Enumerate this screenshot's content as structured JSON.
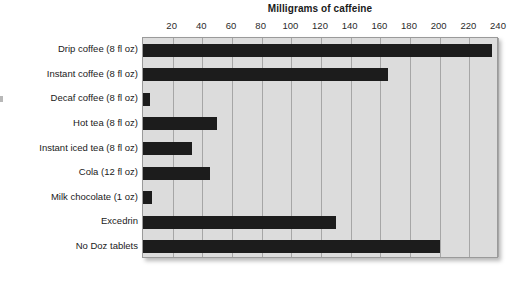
{
  "chart_data": {
    "type": "bar",
    "orientation": "horizontal",
    "title": "Milligrams of caffeine",
    "xlabel": "",
    "ylabel": "",
    "xlim": [
      0,
      240
    ],
    "xticks": [
      20,
      40,
      60,
      80,
      100,
      120,
      140,
      160,
      180,
      200,
      220,
      240
    ],
    "grid": true,
    "legend": false,
    "categories": [
      "Drip coffee (8 fl oz)",
      "Instant coffee (8 fl oz)",
      "Decaf coffee (8 fl oz)",
      "Hot tea (8 fl oz)",
      "Instant iced tea (8 fl oz)",
      "Cola (12 fl oz)",
      "Milk chocolate (1 oz)",
      "Excedrin",
      "No Doz tablets"
    ],
    "values": [
      235,
      165,
      5,
      50,
      33,
      45,
      6,
      130,
      200
    ],
    "bar_color": "#1c1c1c",
    "plot_background": "#dcdcdc",
    "gridline_color": "#a6a6a6"
  }
}
